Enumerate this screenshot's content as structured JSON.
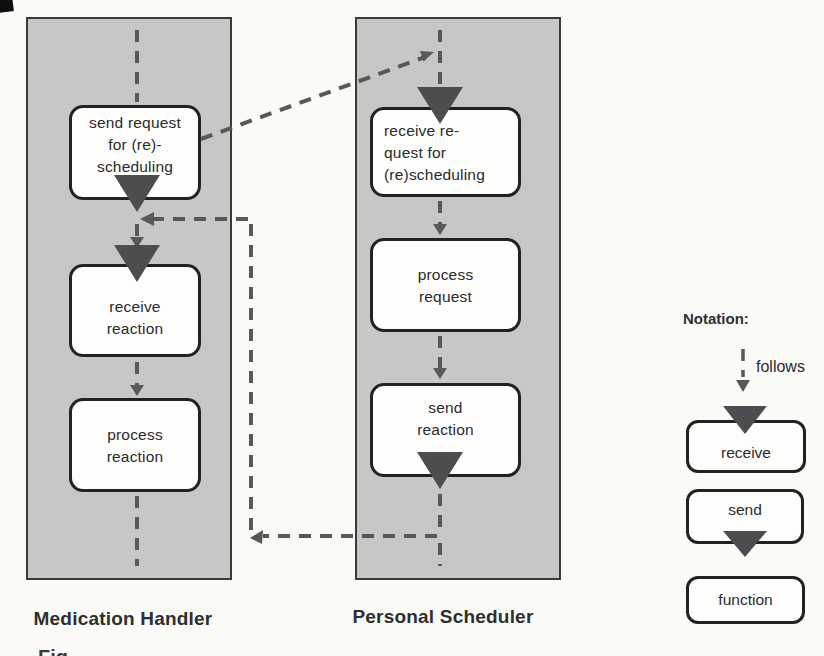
{
  "figure": {
    "partial_caption": "Fig.",
    "lanes": [
      {
        "label": "Medication Handler",
        "nodes": [
          {
            "type": "send",
            "lines": [
              "send request",
              "for (re)-",
              "scheduling"
            ]
          },
          {
            "type": "receive",
            "lines": [
              "receive",
              "reaction"
            ]
          },
          {
            "type": "function",
            "lines": [
              "process",
              "reaction"
            ]
          }
        ]
      },
      {
        "label": "Personal Scheduler",
        "nodes": [
          {
            "type": "receive",
            "lines": [
              "receive re-",
              "quest for",
              "(re)scheduling"
            ]
          },
          {
            "type": "function",
            "lines": [
              "process",
              "request"
            ]
          },
          {
            "type": "send",
            "lines": [
              "send",
              "reaction"
            ]
          }
        ]
      }
    ],
    "messages": [
      {
        "from": "send request for (re)-scheduling (Medication Handler)",
        "to": "receive re-quest for (re)scheduling (Personal Scheduler)"
      },
      {
        "from": "send reaction (Personal Scheduler)",
        "to": "receive reaction (Medication Handler)"
      }
    ],
    "legend": {
      "title": "Notation:",
      "items": [
        {
          "symbol": "dashed-arrow-down",
          "label": "follows"
        },
        {
          "symbol": "box-triangle-on-top",
          "label": "receive"
        },
        {
          "symbol": "box-triangle-bottom",
          "label": "send"
        },
        {
          "symbol": "plain-box",
          "label": "function"
        }
      ]
    }
  },
  "colors": {
    "background": "#fafaf7",
    "lane_fill": "#c8c7c5",
    "lane_border": "#3a3a3a",
    "node_fill": "#fdfdfc",
    "node_border": "#222222",
    "triangle": "#4d4d4f",
    "dash": "#585858",
    "text": "#2b2b2b",
    "label": "#2f2f2f"
  }
}
